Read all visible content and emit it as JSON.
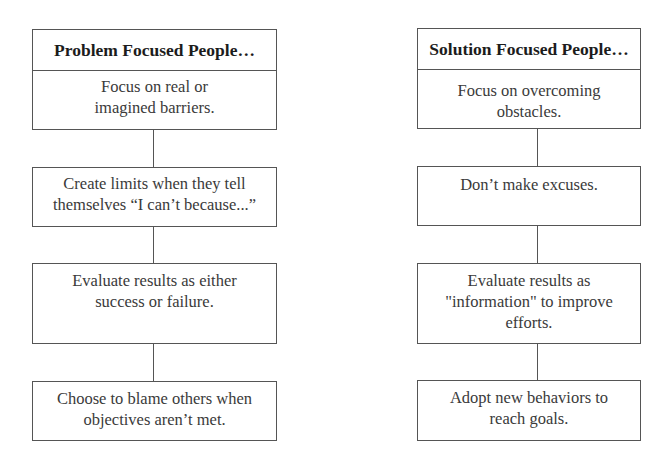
{
  "diagram": {
    "left": {
      "title": "Problem Focused People…",
      "steps": [
        {
          "line1": "Focus on real or",
          "line2": "imagined barriers."
        },
        {
          "line1": "Create limits when they tell",
          "line2": "themselves “I can’t because...”"
        },
        {
          "line1": "Evaluate results as either",
          "line2": "success or failure."
        },
        {
          "line1": "Choose to blame others when",
          "line2": "objectives aren’t met."
        }
      ]
    },
    "right": {
      "title": "Solution Focused People…",
      "steps": [
        {
          "line1": "Focus on overcoming",
          "line2": "obstacles."
        },
        {
          "line1": "Don’t make excuses.",
          "line2": ""
        },
        {
          "line1": "Evaluate results as",
          "line2": "\"information\" to improve",
          "line3": "efforts."
        },
        {
          "line1": "Adopt new behaviors to",
          "line2": "reach goals."
        }
      ]
    }
  }
}
